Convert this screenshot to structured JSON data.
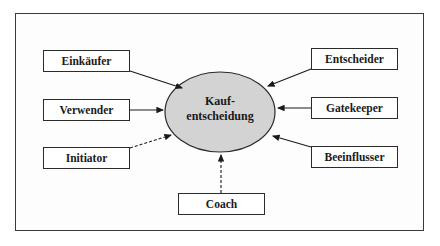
{
  "diagram": {
    "center": {
      "line1": "Kauf-",
      "line2": "entscheidung",
      "fill": "#d3d3d3"
    },
    "roles": {
      "einkaeufer": "Einkäufer",
      "verwender": "Verwender",
      "initiator": "Initiator",
      "entscheider": "Entscheider",
      "gatekeeper": "Gatekeeper",
      "beeinflusser": "Beeinflusser",
      "coach": "Coach"
    },
    "connections": [
      {
        "from": "Einkäufer",
        "style": "solid"
      },
      {
        "from": "Verwender",
        "style": "solid"
      },
      {
        "from": "Initiator",
        "style": "dashed"
      },
      {
        "from": "Entscheider",
        "style": "solid"
      },
      {
        "from": "Gatekeeper",
        "style": "solid"
      },
      {
        "from": "Beeinflusser",
        "style": "solid"
      },
      {
        "from": "Coach",
        "style": "dashed"
      }
    ]
  }
}
